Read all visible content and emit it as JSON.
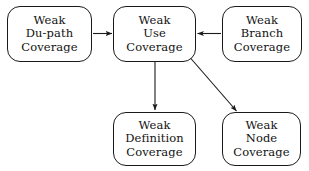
{
  "diagram": {
    "background_color": "#ffffff",
    "line_color": "#1a1a1a",
    "text_color": "#121212",
    "nodes": [
      {
        "id": "weak-du-path-coverage",
        "lines": [
          "Weak",
          "Du-path",
          "Coverage"
        ],
        "x": 7,
        "y": 6,
        "w": 85,
        "h": 56
      },
      {
        "id": "weak-use-coverage",
        "lines": [
          "Weak",
          "Use",
          "Coverage"
        ],
        "x": 113,
        "y": 6,
        "w": 83,
        "h": 56
      },
      {
        "id": "weak-branch-coverage",
        "lines": [
          "Weak",
          "Branch",
          "Coverage"
        ],
        "x": 222,
        "y": 6,
        "w": 80,
        "h": 56
      },
      {
        "id": "weak-definition-coverage",
        "lines": [
          "Weak",
          "Definition",
          "Coverage"
        ],
        "x": 113,
        "y": 112,
        "w": 83,
        "h": 54
      },
      {
        "id": "weak-node-coverage",
        "lines": [
          "Weak",
          "Node",
          "Coverage"
        ],
        "x": 222,
        "y": 112,
        "w": 79,
        "h": 54
      }
    ],
    "edges": [
      {
        "id": "edge-du-path-to-use",
        "from": "weak-du-path-coverage",
        "to": "weak-use-coverage",
        "direction": "right",
        "x1": 93,
        "y1": 33.5,
        "x2": 112,
        "y2": 33.5
      },
      {
        "id": "edge-branch-to-use",
        "from": "weak-branch-coverage",
        "to": "weak-use-coverage",
        "direction": "left",
        "x1": 221,
        "y1": 33.5,
        "x2": 197,
        "y2": 33.5
      },
      {
        "id": "edge-use-to-definition",
        "from": "weak-use-coverage",
        "to": "weak-definition-coverage",
        "direction": "down",
        "x1": 155,
        "y1": 62,
        "x2": 155,
        "y2": 110
      },
      {
        "id": "edge-use-to-node",
        "from": "weak-use-coverage",
        "to": "weak-node-coverage",
        "direction": "down-right",
        "x1": 187,
        "y1": 54,
        "x2": 237,
        "y2": 111
      }
    ]
  }
}
